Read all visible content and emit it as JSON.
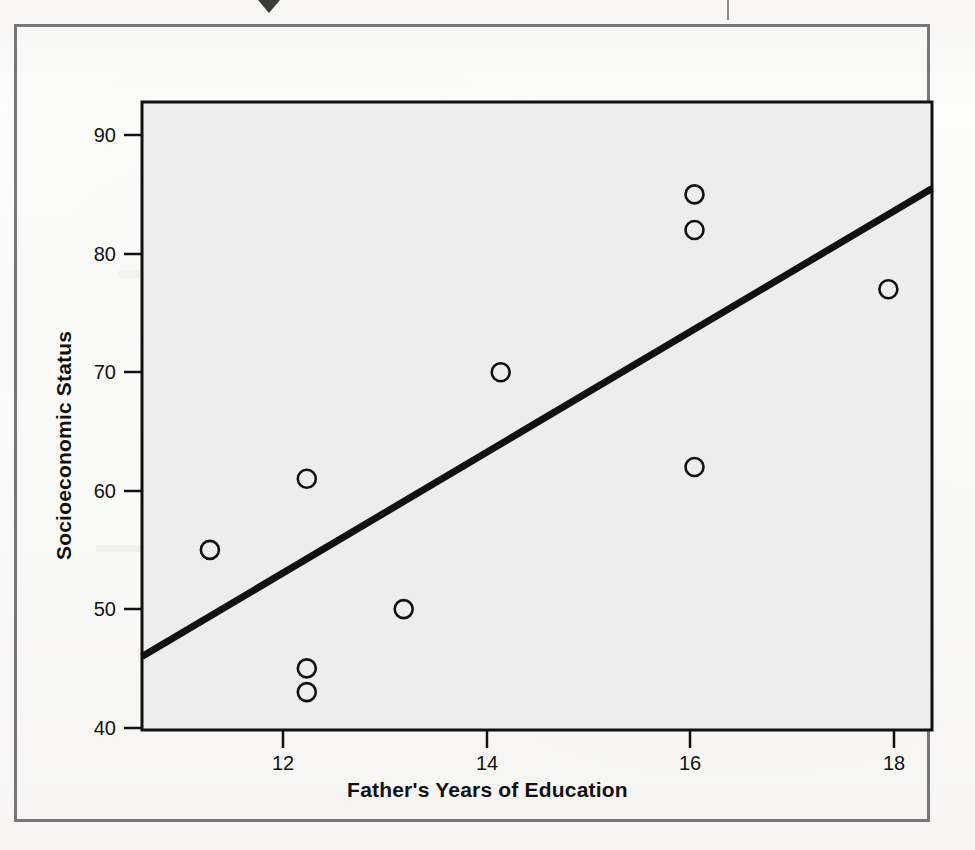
{
  "figure": {
    "y_axis_title": "Socioeconomic Status",
    "x_axis_title": "Father's Years of Education",
    "plot_background_color": "#ededed",
    "marker_color": "#111111",
    "line_color": "#111111",
    "frame_color": "#77777a"
  },
  "axes": {
    "y_ticks": [
      "90",
      "80",
      "70",
      "60",
      "50",
      "40"
    ],
    "x_ticks": [
      "12",
      "14",
      "16",
      "18"
    ]
  },
  "chart_data": {
    "type": "scatter",
    "title": "",
    "xlabel": "Father's Years of Education",
    "ylabel": "Socioeconomic Status",
    "xlim": [
      10.3,
      18.45
    ],
    "ylim": [
      39.8,
      92.8
    ],
    "xticks": [
      12,
      14,
      16,
      18
    ],
    "yticks": [
      40,
      50,
      60,
      70,
      80,
      90
    ],
    "grid": false,
    "legend": "none",
    "marker": "open-circle",
    "points": [
      {
        "x": 11,
        "y": 55
      },
      {
        "x": 12,
        "y": 61
      },
      {
        "x": 12,
        "y": 45
      },
      {
        "x": 12,
        "y": 43
      },
      {
        "x": 13,
        "y": 50
      },
      {
        "x": 14,
        "y": 70
      },
      {
        "x": 16,
        "y": 85
      },
      {
        "x": 16,
        "y": 82
      },
      {
        "x": 16,
        "y": 62
      },
      {
        "x": 18,
        "y": 77
      }
    ],
    "fit_line": {
      "name": "regression line",
      "x_start": 10.3,
      "y_start": 46.0,
      "x_end": 18.45,
      "y_end": 85.5
    }
  }
}
